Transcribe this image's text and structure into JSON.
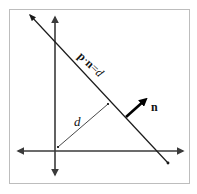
{
  "diagram": {
    "type": "plane-equation-illustration",
    "labels": {
      "plane_equation_p": "p",
      "plane_equation_dot": "·",
      "plane_equation_n": "n",
      "plane_equation_eq": "=",
      "plane_equation_d": "d",
      "normal_label": "n",
      "distance_label": "d"
    },
    "colors": {
      "frame": "#bdbdbd",
      "axis": "#3a3a3a",
      "line": "#1a1a1a",
      "normal": "#000000"
    },
    "elements": {
      "x_axis": {
        "x1": 18,
        "y1": 151,
        "x2": 183,
        "y2": 151
      },
      "y_axis": {
        "x1": 55,
        "y1": 17,
        "x2": 55,
        "y2": 175
      },
      "plane_line": {
        "x1": 30,
        "y1": 15,
        "x2": 168,
        "y2": 163
      },
      "distance_segment": {
        "x1": 58,
        "y1": 147,
        "x2": 108,
        "y2": 104
      },
      "normal_vector": {
        "x1": 126,
        "y1": 117,
        "x2": 147,
        "y2": 98
      }
    }
  }
}
